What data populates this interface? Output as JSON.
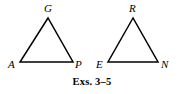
{
  "figure": {
    "background_color": "#ffffff",
    "stroke_color": "#000000",
    "caption": "Exs. 3–5",
    "shapes": [
      {
        "name": "triangle-gap",
        "label": "Triangle GAP",
        "vertices": [
          {
            "id": "G",
            "label": "G",
            "x": 48,
            "y": 18,
            "label_x": 44,
            "label_y": 12
          },
          {
            "id": "A",
            "label": "A",
            "x": 20,
            "y": 62,
            "label_x": 8,
            "label_y": 68
          },
          {
            "id": "P",
            "label": "P",
            "x": 73,
            "y": 62,
            "label_x": 75,
            "label_y": 68
          }
        ]
      },
      {
        "name": "triangle-ren",
        "label": "Triangle REN",
        "vertices": [
          {
            "id": "R",
            "label": "R",
            "x": 133,
            "y": 18,
            "label_x": 129,
            "label_y": 12
          },
          {
            "id": "E",
            "label": "E",
            "x": 108,
            "y": 62,
            "label_x": 96,
            "label_y": 68
          },
          {
            "id": "N",
            "label": "N",
            "x": 158,
            "y": 62,
            "label_x": 161,
            "label_y": 68
          }
        ]
      }
    ]
  }
}
